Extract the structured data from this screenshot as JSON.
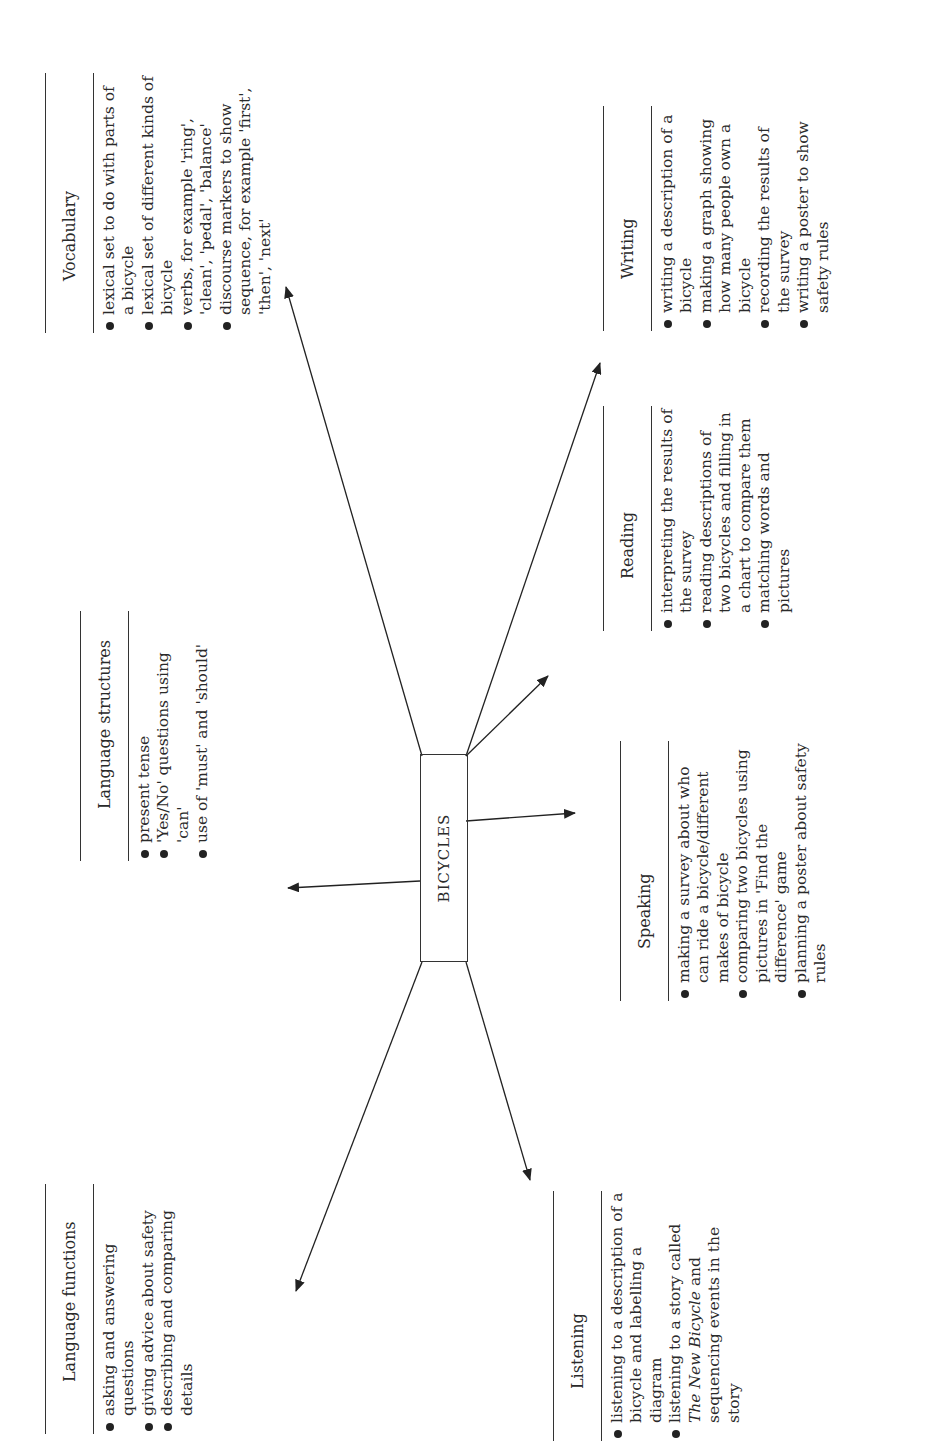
{
  "center": {
    "label": "BICYCLES"
  },
  "sections": {
    "language_functions": {
      "title": "Language functions",
      "items": [
        "asking and answering questions",
        "giving advice about safety",
        "describing and comparing details"
      ]
    },
    "language_structures": {
      "title": "Language structures",
      "items": [
        "present tense",
        "'Yes/No' questions using 'can'",
        "use of 'must' and 'should'"
      ]
    },
    "vocabulary": {
      "title": "Vocabulary",
      "items": [
        "lexical set to do with parts of a bicycle",
        "lexical set of different kinds of bicycle",
        "verbs, for example 'ring', 'clean', 'pedal', 'balance'",
        "discourse markers to show sequence, for example 'first', 'then', 'next'"
      ]
    },
    "listening": {
      "title": "Listening",
      "items": [
        "listening to a description of a bicycle and labelling a diagram",
        "listening to a story called The New Bicycle and sequencing events in the story"
      ],
      "story_title": "The New Bicycle"
    },
    "speaking": {
      "title": "Speaking",
      "items": [
        "making a survey about who can ride a bicycle/different makes of bicycle",
        "comparing two bicycles using pictures in 'Find the difference' game",
        "planning a poster about safety rules"
      ]
    },
    "reading": {
      "title": "Reading",
      "items": [
        "interpreting the results of the survey",
        "reading descriptions of two bicycles and filling in a chart to compare them",
        "matching words and pictures"
      ]
    },
    "writing": {
      "title": "Writing",
      "items": [
        "writing a description of a bicycle",
        "making a graph showing how many people own a bicycle",
        "recording the results of the survey",
        "writing a poster to show safety rules"
      ]
    }
  }
}
